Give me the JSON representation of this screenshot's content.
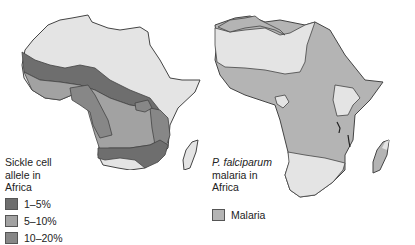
{
  "left_map": {
    "title_line1": "Sickle cell",
    "title_line2": "allele in",
    "title_line3": "Africa",
    "legend": [
      {
        "label": "1–5%",
        "color": "#6e6e6e"
      },
      {
        "label": "5–10%",
        "color": "#9e9e9e"
      },
      {
        "label": "10–20%",
        "color": "#858585"
      }
    ]
  },
  "right_map": {
    "title_italic": "P. falciparum",
    "title_line2": "malaria in",
    "title_line3": "Africa",
    "legend": [
      {
        "label": "Malaria",
        "color": "#b4b4b4"
      }
    ]
  },
  "colors": {
    "land_base": "#e4e4e4",
    "outline": "#444444"
  }
}
